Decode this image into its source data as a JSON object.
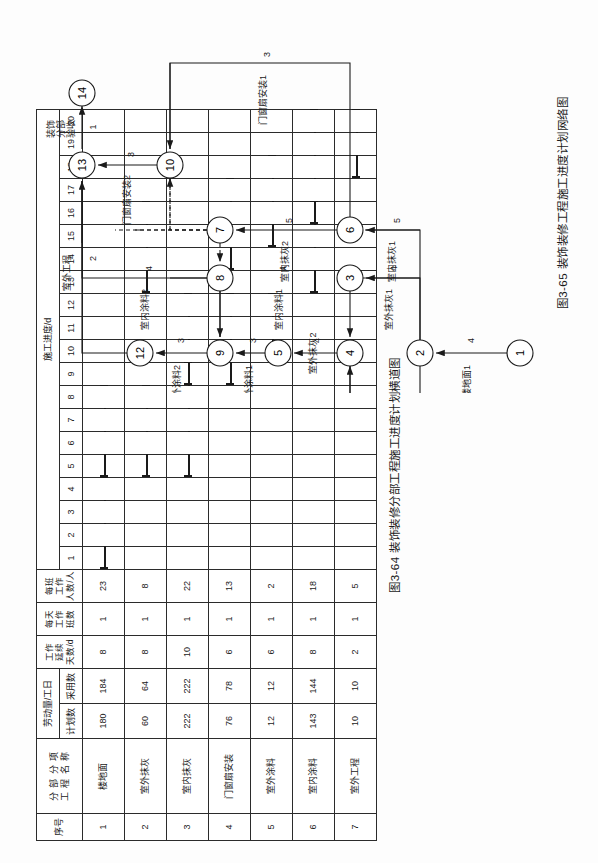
{
  "figure_gantt": {
    "caption": "图3-64  装饰装修分部工程施工进度计划横道图",
    "header": {
      "seq": "序号",
      "name_line1": "分 部 分 项",
      "name_line2": "工 程 名 称",
      "labor": "劳动量/工日",
      "labor_plan": "计划数",
      "labor_used": "采用数",
      "duration_l1": "工作",
      "duration_l2": "延续",
      "duration_l3": "天数/d",
      "shifts_l1": "每天",
      "shifts_l2": "工作",
      "shifts_l3": "班数",
      "people_l1": "每班",
      "people_l2": "工作",
      "people_l3": "人数/人",
      "schedule": "施工进度/d"
    },
    "day_ticks": [
      1,
      2,
      3,
      4,
      5,
      6,
      7,
      8,
      9,
      10,
      11,
      12,
      13,
      14,
      15,
      16,
      17,
      18,
      19,
      20
    ],
    "rows": [
      {
        "seq": "1",
        "name": "楼地面",
        "plan": "180",
        "used": "184",
        "days": "8",
        "shifts": "1",
        "people": "23",
        "bars": [
          {
            "start": 1,
            "end": 4
          },
          {
            "start": 5,
            "end": 8
          }
        ]
      },
      {
        "seq": "2",
        "name": "室外抹灰",
        "plan": "60",
        "used": "64",
        "days": "8",
        "shifts": "1",
        "people": "8",
        "bars": [
          {
            "start": 5,
            "end": 8
          },
          {
            "start": 13,
            "end": 16
          }
        ]
      },
      {
        "seq": "3",
        "name": "室内抹灰",
        "plan": "222",
        "used": "222",
        "days": "10",
        "shifts": "1",
        "people": "22",
        "bars": [
          {
            "start": 5,
            "end": 9
          },
          {
            "start": 9,
            "end": 12
          }
        ]
      },
      {
        "seq": "4",
        "name": "门窗扇安装",
        "plan": "76",
        "used": "78",
        "days": "6",
        "shifts": "1",
        "people": "13",
        "bars": [
          {
            "start": 9,
            "end": 12
          },
          {
            "start": 14,
            "end": 17
          }
        ]
      },
      {
        "seq": "5",
        "name": "室外涂料",
        "plan": "12",
        "used": "12",
        "days": "6",
        "shifts": "1",
        "people": "2",
        "bars": [
          {
            "start": 10,
            "end": 12
          },
          {
            "start": 15,
            "end": 18
          }
        ]
      },
      {
        "seq": "6",
        "name": "室内涂料",
        "plan": "143",
        "used": "144",
        "days": "8",
        "shifts": "1",
        "people": "18",
        "bars": [
          {
            "start": 13,
            "end": 16
          },
          {
            "start": 16,
            "end": 20
          }
        ]
      },
      {
        "seq": "7",
        "name": "室外工程",
        "plan": "10",
        "used": "10",
        "days": "2",
        "shifts": "1",
        "people": "5",
        "bars": [
          {
            "start": 18,
            "end": 20
          }
        ]
      }
    ]
  },
  "figure_network": {
    "caption": "图3-65  装饰装修工程施工进度计划网络图",
    "nodes": [
      {
        "id": "1",
        "x": 40,
        "y": 500
      },
      {
        "id": "2",
        "x": 40,
        "y": 400
      },
      {
        "id": "3",
        "x": 115,
        "y": 330
      },
      {
        "id": "4",
        "x": 40,
        "y": 330
      },
      {
        "id": "5",
        "x": 40,
        "y": 258
      },
      {
        "id": "6",
        "x": 163,
        "y": 330
      },
      {
        "id": "7",
        "x": 163,
        "y": 200
      },
      {
        "id": "8",
        "x": 115,
        "y": 200
      },
      {
        "id": "9",
        "x": 40,
        "y": 200
      },
      {
        "id": "10",
        "x": 228,
        "y": 150
      },
      {
        "id": "12",
        "x": 40,
        "y": 120
      },
      {
        "id": "13",
        "x": 228,
        "y": 62
      },
      {
        "id": "14",
        "x": 300,
        "y": 62
      }
    ],
    "activities": [
      {
        "name": "楼地面1",
        "dur": "4"
      },
      {
        "name": "楼地面2",
        "dur": "4"
      },
      {
        "name": "室外抹灰1",
        "dur": "4"
      },
      {
        "name": "室外抹灰2",
        "dur": "4"
      },
      {
        "name": "室内抹灰1",
        "dur": "5"
      },
      {
        "name": "室内抹灰2",
        "dur": "5"
      },
      {
        "name": "室外涂料1",
        "dur": "3"
      },
      {
        "name": "室外涂料2",
        "dur": "3"
      },
      {
        "name": "室内涂料1",
        "dur": "4"
      },
      {
        "name": "室内涂料2",
        "dur": "4"
      },
      {
        "name": "门窗扇安装1",
        "dur": "3"
      },
      {
        "name": "门窗扇安装2",
        "dur": "3"
      },
      {
        "name": "室外工程",
        "dur": "2"
      },
      {
        "name": "装饰\n分部\n验收",
        "dur": "1"
      }
    ],
    "acceptance_label_l1": "装饰",
    "acceptance_label_l2": "分部",
    "acceptance_label_l3": "验收",
    "acceptance_dur": "1"
  }
}
